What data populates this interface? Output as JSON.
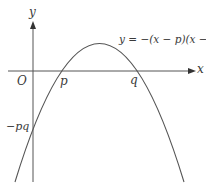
{
  "diagram": {
    "type": "function-graph",
    "labels": {
      "y_axis": "y",
      "x_axis": "x",
      "origin": "O",
      "root_p": "p",
      "root_q": "q",
      "y_intercept": "−pq",
      "equation": "y = −(x − p)(x − q)"
    },
    "curve": {
      "kind": "downward parabola",
      "roots": [
        "p",
        "q"
      ],
      "y_intercept": "−pq",
      "stroke_color": "#555555"
    },
    "axes": {
      "stroke_color": "#555555",
      "arrowheads": [
        "x",
        "y"
      ]
    }
  }
}
